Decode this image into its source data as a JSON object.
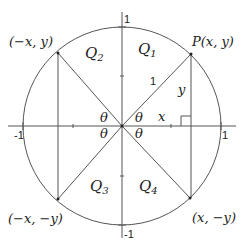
{
  "diagram": {
    "colors": {
      "line": "#555555",
      "text": "#222222",
      "background": "#ffffff"
    },
    "axes": {
      "x_min_label": "-1",
      "x_max_label": "1",
      "y_max_label": "1",
      "y_min_label": "-1"
    },
    "quadrants": {
      "q1": "Q",
      "q1_sub": "1",
      "q2": "Q",
      "q2_sub": "2",
      "q3": "Q",
      "q3_sub": "3",
      "q4": "Q",
      "q4_sub": "4"
    },
    "points": {
      "p": "P(x, y)",
      "q2_point": "(−x, y)",
      "q3_point": "(−x, −y)",
      "q4_point": "(x, −y)"
    },
    "triangle": {
      "hypotenuse": "1",
      "leg_x": "x",
      "leg_y": "y"
    },
    "angles": {
      "q1": "θ",
      "q2": "θ",
      "q3": "θ",
      "q4": "θ"
    }
  }
}
